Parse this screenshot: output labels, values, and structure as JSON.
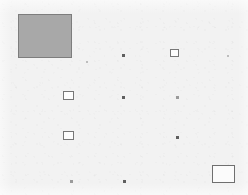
{
  "canvas": {
    "width": 248,
    "height": 195,
    "background_color": "#f2f2f2",
    "title": "Annotated Region Map"
  },
  "palette": {
    "plate_background": "#f2f2f2",
    "filled_fill": "#a8a8a8",
    "filled_stroke": "#7d7d7d",
    "open_fill": "#fbfbfb",
    "open_stroke": "#6f6f6f",
    "marker_dark": "#5f5f5f",
    "marker_faint": "#9a9a9a",
    "marker_very_faint": "#bdbdbd"
  },
  "regions": [
    {
      "id": "region-filled-large",
      "kind": "filled-rect",
      "label": "",
      "x": 18,
      "y": 14,
      "width": 54,
      "height": 44
    },
    {
      "id": "region-open-top-right",
      "kind": "open-rect-small",
      "label": "",
      "x": 170,
      "y": 49,
      "width": 9,
      "height": 8
    },
    {
      "id": "region-open-mid-left",
      "kind": "open-rect-small",
      "label": "",
      "x": 63,
      "y": 91,
      "width": 11,
      "height": 9
    },
    {
      "id": "region-open-lower-left",
      "kind": "open-rect-small",
      "label": "",
      "x": 63,
      "y": 131,
      "width": 11,
      "height": 9
    },
    {
      "id": "region-open-bottom-right",
      "kind": "open-rect",
      "label": "",
      "x": 212,
      "y": 165,
      "width": 23,
      "height": 18
    }
  ],
  "markers": [
    {
      "id": "marker-1",
      "kind": "dot",
      "label": "",
      "x": 122,
      "y": 54,
      "size": 3
    },
    {
      "id": "marker-2",
      "kind": "dot very-faint",
      "label": "",
      "x": 227,
      "y": 55,
      "size": 2
    },
    {
      "id": "marker-3",
      "kind": "dot",
      "label": "",
      "x": 122,
      "y": 96,
      "size": 3
    },
    {
      "id": "marker-4",
      "kind": "dot faint",
      "label": "",
      "x": 176,
      "y": 96,
      "size": 3
    },
    {
      "id": "marker-5",
      "kind": "dot",
      "label": "",
      "x": 176,
      "y": 136,
      "size": 3
    },
    {
      "id": "marker-6",
      "kind": "dot faint",
      "label": "",
      "x": 70,
      "y": 180,
      "size": 3
    },
    {
      "id": "marker-7",
      "kind": "dot",
      "label": "",
      "x": 123,
      "y": 180,
      "size": 3
    },
    {
      "id": "marker-8",
      "kind": "dot very-faint",
      "label": "",
      "x": 86,
      "y": 61,
      "size": 2
    }
  ]
}
